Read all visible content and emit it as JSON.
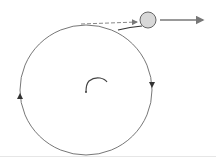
{
  "diagram": {
    "colors": {
      "path": "#777777",
      "ball_fill": "#d8d8d8",
      "ball_stroke": "#666666",
      "arrow": "#777777",
      "string": "#444444"
    },
    "circle": {
      "cx": 86,
      "cy": 90,
      "rx": 66,
      "ry": 65
    },
    "ball": {
      "cx": 148,
      "cy": 20,
      "r": 8
    },
    "direction_arrows": [
      {
        "name": "right-side-down",
        "x": 152,
        "y": 84
      },
      {
        "name": "left-side-up",
        "x": 20,
        "y": 97
      }
    ],
    "dashed_arrow": {
      "x1": 81,
      "y1": 23,
      "x2": 138,
      "y2": 22
    },
    "velocity_arrow": {
      "x1": 160,
      "y1": 20,
      "x2": 205,
      "y2": 20
    }
  }
}
